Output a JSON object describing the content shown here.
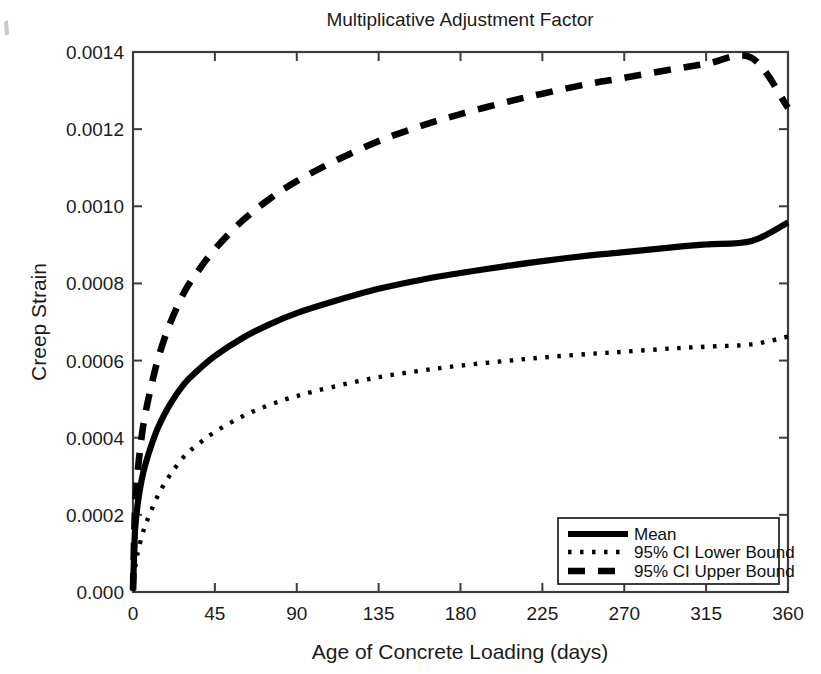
{
  "chart_data": {
    "type": "line",
    "title": "Multiplicative Adjustment Factor",
    "xlabel": "Age of Concrete Loading (days)",
    "ylabel": "Creep Strain",
    "xlim": [
      0,
      360
    ],
    "ylim": [
      0.0,
      0.0014
    ],
    "grid": false,
    "legend_position": "lower right",
    "xticks": [
      0,
      45,
      90,
      135,
      180,
      225,
      270,
      315,
      360
    ],
    "xtick_labels": [
      "0",
      "45",
      "90",
      "135",
      "180",
      "225",
      "270",
      "315",
      "360"
    ],
    "yticks": [
      0.0,
      0.0002,
      0.0004,
      0.0006,
      0.0008,
      0.001,
      0.0012,
      0.0014
    ],
    "ytick_labels": [
      "0.000",
      "0.0002",
      "0.0004",
      "0.0006",
      "0.0008",
      "0.0010",
      "0.0012",
      "0.0014"
    ],
    "x": [
      0,
      1,
      2,
      3,
      5,
      7,
      10,
      14,
      20,
      28,
      35,
      45,
      60,
      75,
      90,
      110,
      135,
      160,
      180,
      205,
      225,
      250,
      270,
      295,
      315,
      340,
      360
    ],
    "series": [
      {
        "name": "Mean",
        "style": "solid",
        "color": "#000000",
        "values": [
          4e-06,
          0.000148,
          0.000205,
          0.000242,
          0.000296,
          0.000334,
          0.000379,
          0.000429,
          0.000484,
          0.000539,
          0.000572,
          0.000612,
          0.000658,
          0.000694,
          0.000723,
          0.000753,
          0.000786,
          0.000811,
          0.000827,
          0.000845,
          0.000858,
          0.000872,
          0.000881,
          0.000893,
          0.000901,
          0.00091,
          0.000958
        ]
      },
      {
        "name": "95% CI Lower Bound",
        "style": "dotted",
        "color": "#000000",
        "values": [
          2e-06,
          5.6e-05,
          8.7e-05,
          0.00011,
          0.000147,
          0.000176,
          0.000211,
          0.000253,
          0.000301,
          0.000351,
          0.00038,
          0.000415,
          0.000455,
          0.000485,
          0.000508,
          0.000532,
          0.000557,
          0.000575,
          0.000587,
          0.000599,
          0.000608,
          0.000617,
          0.000623,
          0.000631,
          0.000636,
          0.000642,
          0.000662
        ]
      },
      {
        "name": "95% CI Upper Bound",
        "style": "dashed",
        "color": "#000000",
        "values": [
          6e-06,
          0.000201,
          0.000279,
          0.000332,
          0.000411,
          0.000467,
          0.000533,
          0.000608,
          0.000692,
          0.000776,
          0.000827,
          0.000889,
          0.000962,
          0.001019,
          0.001065,
          0.001115,
          0.001169,
          0.001211,
          0.001239,
          0.00127,
          0.001292,
          0.001317,
          0.001333,
          0.001354,
          0.001369,
          0.001385,
          0.001255
        ]
      }
    ]
  },
  "legend": {
    "entries": [
      {
        "label": "Mean"
      },
      {
        "label": "95% CI Lower Bound"
      },
      {
        "label": "95% CI Upper Bound"
      }
    ]
  }
}
